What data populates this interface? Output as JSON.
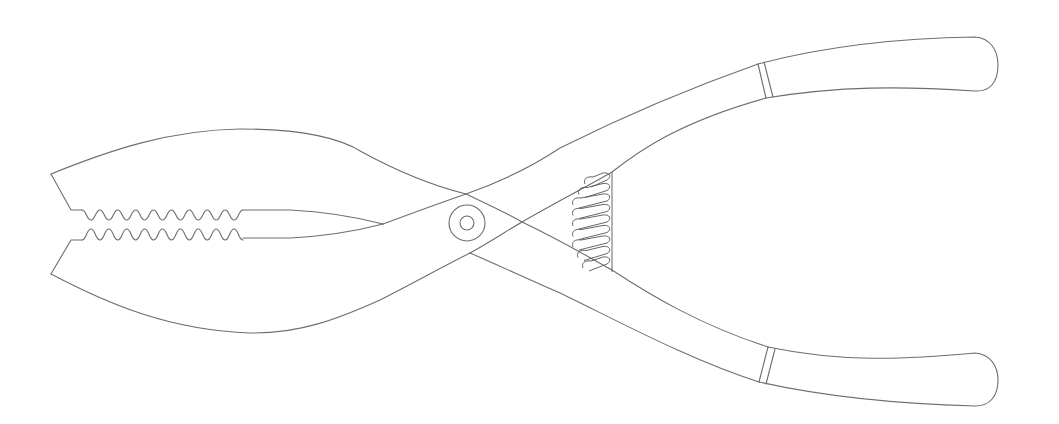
{
  "figure": {
    "subject": "spring-loaded pliers with serrated jaws",
    "colors": {
      "background": "#ffffff",
      "line": "#6e6e6e",
      "spring": "#555555"
    },
    "parts": [
      {
        "id": "upper-jaw",
        "label": "upper jaw with serrated teeth"
      },
      {
        "id": "lower-jaw",
        "label": "lower jaw with serrated teeth"
      },
      {
        "id": "pivot",
        "label": "pivot rivet"
      },
      {
        "id": "spring",
        "label": "coil spring"
      },
      {
        "id": "upper-handle",
        "label": "upper handle"
      },
      {
        "id": "lower-handle",
        "label": "lower handle"
      }
    ],
    "teeth_count": 9
  }
}
